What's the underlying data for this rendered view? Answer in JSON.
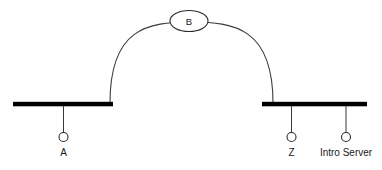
{
  "diagram": {
    "type": "network-topology",
    "background_color": "#ffffff",
    "line_color": "#3a3a3a",
    "bar_color": "#000000",
    "text_color": "#1a1a1a",
    "segments": [
      {
        "id": "left-bus",
        "name": "left-bus-bar",
        "x1": 13,
        "x2": 113,
        "y": 104,
        "thickness": 4.5
      },
      {
        "id": "right-bus",
        "name": "right-bus-bar",
        "x1": 262,
        "x2": 367,
        "y": 104,
        "thickness": 4.5
      }
    ],
    "arc": {
      "name": "inter-bus-arc",
      "start_x": 110,
      "start_y": 103,
      "end_x": 273,
      "end_y": 103,
      "apex_y": 23,
      "path": "M 110 103 C 110 28, 148 22, 191 22 C 234 22, 273 28, 273 103"
    },
    "cloud": {
      "name": "cloud-node-b",
      "label": "B",
      "cx": 189,
      "cy": 21,
      "rx": 19,
      "ry": 10.5
    },
    "nodes": [
      {
        "id": "node-a",
        "label": "A",
        "drop_x": 63.5,
        "drop_top_y": 106,
        "circle_cy": 137,
        "circle_r": 4.5,
        "label_y": 156
      },
      {
        "id": "node-z",
        "label": "Z",
        "drop_x": 291.5,
        "drop_top_y": 106,
        "circle_cy": 137,
        "circle_r": 4.5,
        "label_y": 156
      },
      {
        "id": "node-intro-server",
        "label": "Intro Server",
        "drop_x": 346,
        "drop_top_y": 106,
        "circle_cy": 137,
        "circle_r": 4.5,
        "label_y": 156
      }
    ]
  }
}
